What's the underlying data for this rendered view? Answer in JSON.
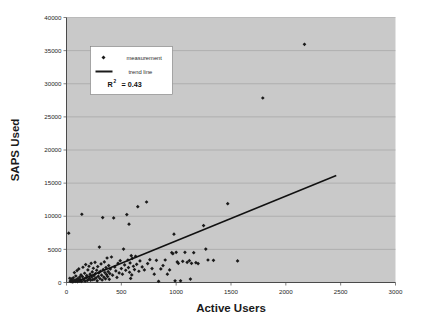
{
  "chart_data": {
    "type": "scatter",
    "title": "",
    "xlabel": "Active Users",
    "ylabel": "SAPS Used",
    "xlim": [
      0,
      3000
    ],
    "ylim": [
      0,
      40000
    ],
    "xticks": [
      0,
      500,
      1000,
      1500,
      2000,
      2500,
      3000
    ],
    "xtick_labels": [
      "0",
      "500",
      "1000",
      "1500",
      "2000",
      "2500",
      "3000"
    ],
    "yticks": [
      0,
      5000,
      10000,
      15000,
      20000,
      25000,
      30000,
      35000,
      40000
    ],
    "ytick_labels": [
      "0",
      "5000",
      "10000",
      "15000",
      "20000",
      "25000",
      "30000",
      "35000",
      "40000"
    ],
    "grid": "horizontal",
    "legend_position": "upper-left-inside",
    "legend": [
      {
        "key": "measurement",
        "label": "measurement",
        "marker": "diamond",
        "color": "#1a1a1a"
      },
      {
        "key": "trend line",
        "label": "trend line",
        "marker": "line",
        "color": "#1a1a1a"
      }
    ],
    "annotation_r2_symbol": "R",
    "annotation_r2_exponent": "2",
    "annotation_r2_value": "= 0.43",
    "r_squared": 0.43,
    "plot_bg_color": "#c9c9c9",
    "gridline_color": "#9d9d9d",
    "axis_color": "#4a4a4a",
    "marker_color": "#1a1a1a",
    "trendline_color": "#111111",
    "trend_line": {
      "x_start": 120,
      "y_start": 330,
      "x_end": 2460,
      "y_end": 16150
    },
    "series": [
      {
        "name": "measurement",
        "points": [
          [
            20,
            7450
          ],
          [
            30,
            640
          ],
          [
            35,
            180
          ],
          [
            40,
            260
          ],
          [
            45,
            520
          ],
          [
            50,
            120
          ],
          [
            55,
            380
          ],
          [
            58,
            95
          ],
          [
            62,
            700
          ],
          [
            68,
            210
          ],
          [
            72,
            1500
          ],
          [
            75,
            300
          ],
          [
            80,
            150
          ],
          [
            85,
            980
          ],
          [
            88,
            420
          ],
          [
            92,
            250
          ],
          [
            96,
            1800
          ],
          [
            100,
            130
          ],
          [
            104,
            600
          ],
          [
            108,
            340
          ],
          [
            112,
            2050
          ],
          [
            116,
            190
          ],
          [
            120,
            820
          ],
          [
            124,
            450
          ],
          [
            128,
            270
          ],
          [
            132,
            1150
          ],
          [
            136,
            160
          ],
          [
            140,
            10300
          ],
          [
            145,
            900
          ],
          [
            150,
            2300
          ],
          [
            155,
            380
          ],
          [
            160,
            560
          ],
          [
            165,
            1400
          ],
          [
            170,
            220
          ],
          [
            175,
            2700
          ],
          [
            180,
            740
          ],
          [
            185,
            1050
          ],
          [
            190,
            300
          ],
          [
            195,
            1900
          ],
          [
            200,
            480
          ],
          [
            205,
            2450
          ],
          [
            210,
            660
          ],
          [
            215,
            1250
          ],
          [
            220,
            350
          ],
          [
            225,
            2900
          ],
          [
            230,
            840
          ],
          [
            235,
            1600
          ],
          [
            240,
            420
          ],
          [
            245,
            2150
          ],
          [
            250,
            1020
          ],
          [
            255,
            520
          ],
          [
            260,
            3050
          ],
          [
            265,
            1350
          ],
          [
            270,
            700
          ],
          [
            275,
            1850
          ],
          [
            280,
            260
          ],
          [
            285,
            2400
          ],
          [
            290,
            930
          ],
          [
            295,
            1450
          ],
          [
            300,
            5350
          ],
          [
            305,
            600
          ],
          [
            310,
            1700
          ],
          [
            315,
            2800
          ],
          [
            320,
            1100
          ],
          [
            325,
            380
          ],
          [
            330,
            9800
          ],
          [
            335,
            1950
          ],
          [
            340,
            820
          ],
          [
            345,
            3100
          ],
          [
            350,
            1500
          ],
          [
            355,
            560
          ],
          [
            360,
            2250
          ],
          [
            365,
            1200
          ],
          [
            370,
            3700
          ],
          [
            375,
            900
          ],
          [
            380,
            1650
          ],
          [
            385,
            2550
          ],
          [
            390,
            480
          ],
          [
            395,
            1350
          ],
          [
            400,
            2050
          ],
          [
            410,
            3850
          ],
          [
            420,
            1100
          ],
          [
            430,
            9750
          ],
          [
            440,
            2350
          ],
          [
            450,
            1750
          ],
          [
            460,
            760
          ],
          [
            470,
            2900
          ],
          [
            480,
            1450
          ],
          [
            490,
            3300
          ],
          [
            500,
            2100
          ],
          [
            510,
            1250
          ],
          [
            520,
            5050
          ],
          [
            530,
            2650
          ],
          [
            540,
            1850
          ],
          [
            550,
            10250
          ],
          [
            560,
            3400
          ],
          [
            565,
            2250
          ],
          [
            570,
            8800
          ],
          [
            575,
            1550
          ],
          [
            580,
            2950
          ],
          [
            585,
            620
          ],
          [
            590,
            4050
          ],
          [
            595,
            1150
          ],
          [
            600,
            3650
          ],
          [
            610,
            2450
          ],
          [
            620,
            1950
          ],
          [
            630,
            3950
          ],
          [
            640,
            2750
          ],
          [
            650,
            11450
          ],
          [
            660,
            1700
          ],
          [
            670,
            3250
          ],
          [
            690,
            2350
          ],
          [
            710,
            1900
          ],
          [
            730,
            12150
          ],
          [
            740,
            2850
          ],
          [
            760,
            3450
          ],
          [
            780,
            2100
          ],
          [
            800,
            1250
          ],
          [
            820,
            3350
          ],
          [
            840,
            180
          ],
          [
            860,
            2050
          ],
          [
            880,
            2550
          ],
          [
            900,
            3400
          ],
          [
            920,
            1250
          ],
          [
            940,
            1900
          ],
          [
            960,
            4500
          ],
          [
            970,
            4350
          ],
          [
            980,
            7300
          ],
          [
            990,
            250
          ],
          [
            1000,
            4550
          ],
          [
            1010,
            3100
          ],
          [
            1020,
            2900
          ],
          [
            1040,
            260
          ],
          [
            1060,
            3200
          ],
          [
            1080,
            4550
          ],
          [
            1100,
            3050
          ],
          [
            1120,
            3300
          ],
          [
            1130,
            520
          ],
          [
            1140,
            2900
          ],
          [
            1160,
            4500
          ],
          [
            1180,
            3000
          ],
          [
            1200,
            2850
          ],
          [
            1250,
            8600
          ],
          [
            1270,
            5050
          ],
          [
            1290,
            3400
          ],
          [
            1340,
            3350
          ],
          [
            1470,
            11900
          ],
          [
            1560,
            3250
          ],
          [
            1790,
            27850
          ],
          [
            2170,
            35950
          ]
        ]
      }
    ]
  },
  "axis_titles": {
    "x": "Active Users",
    "y": "SAPS Used"
  }
}
